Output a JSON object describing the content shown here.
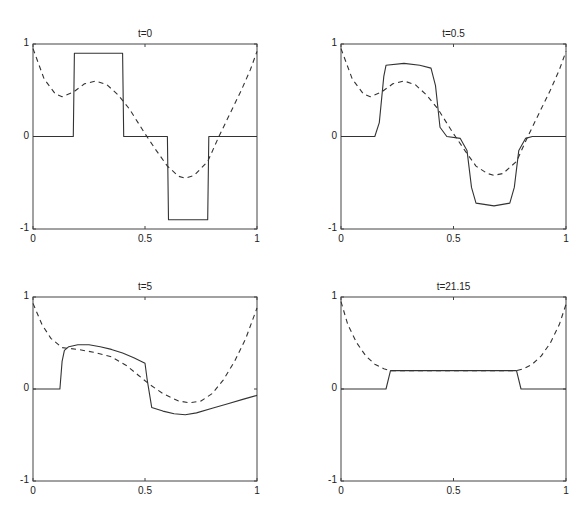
{
  "chart_data": [
    {
      "type": "line",
      "title": "t=0",
      "xlabel": "",
      "ylabel": "",
      "xlim": [
        0,
        1
      ],
      "ylim": [
        -1,
        1
      ],
      "xticks": [
        "0",
        "0.5",
        "1"
      ],
      "yticks": [
        "-1",
        "0",
        "1"
      ],
      "grid": false,
      "series": [
        {
          "name": "solution",
          "style": "solid",
          "x": [
            0,
            0.18,
            0.185,
            0.4,
            0.405,
            0.6,
            0.605,
            0.78,
            0.785,
            1
          ],
          "y": [
            0,
            0,
            0.9,
            0.9,
            0,
            0,
            -0.9,
            -0.9,
            0,
            0
          ]
        },
        {
          "name": "reference",
          "style": "dashed",
          "x": [
            0,
            0.05,
            0.1,
            0.13,
            0.18,
            0.23,
            0.28,
            0.33,
            0.38,
            0.43,
            0.5,
            0.55,
            0.6,
            0.65,
            0.68,
            0.72,
            0.78,
            0.83,
            0.88,
            0.93,
            0.97,
            1
          ],
          "y": [
            0.95,
            0.62,
            0.46,
            0.43,
            0.48,
            0.57,
            0.6,
            0.56,
            0.45,
            0.3,
            0.03,
            -0.15,
            -0.32,
            -0.43,
            -0.45,
            -0.42,
            -0.27,
            0,
            0.25,
            0.5,
            0.72,
            0.92
          ]
        }
      ]
    },
    {
      "type": "line",
      "title": "t=0.5",
      "xlabel": "",
      "ylabel": "",
      "xlim": [
        0,
        1
      ],
      "ylim": [
        -1,
        1
      ],
      "xticks": [
        "0",
        "0.5",
        "1"
      ],
      "yticks": [
        "-1",
        "0",
        "1"
      ],
      "grid": false,
      "series": [
        {
          "name": "solution",
          "style": "solid",
          "x": [
            0,
            0.15,
            0.17,
            0.19,
            0.2,
            0.28,
            0.35,
            0.4,
            0.42,
            0.44,
            0.47,
            0.53,
            0.56,
            0.58,
            0.6,
            0.68,
            0.75,
            0.77,
            0.79,
            0.82,
            0.85,
            1
          ],
          "y": [
            0,
            0,
            0.15,
            0.65,
            0.77,
            0.79,
            0.77,
            0.74,
            0.55,
            0.1,
            0.0,
            -0.02,
            -0.15,
            -0.55,
            -0.72,
            -0.75,
            -0.72,
            -0.55,
            -0.15,
            -0.02,
            0,
            0
          ]
        },
        {
          "name": "reference",
          "style": "dashed",
          "x": [
            0,
            0.05,
            0.1,
            0.13,
            0.18,
            0.23,
            0.28,
            0.33,
            0.38,
            0.43,
            0.5,
            0.55,
            0.6,
            0.65,
            0.68,
            0.72,
            0.78,
            0.83,
            0.88,
            0.93,
            0.97,
            1
          ],
          "y": [
            0.95,
            0.62,
            0.46,
            0.43,
            0.48,
            0.57,
            0.6,
            0.56,
            0.45,
            0.3,
            0.03,
            -0.15,
            -0.32,
            -0.4,
            -0.42,
            -0.4,
            -0.27,
            0,
            0.25,
            0.5,
            0.72,
            0.92
          ]
        }
      ]
    },
    {
      "type": "line",
      "title": "t=5",
      "xlabel": "",
      "ylabel": "",
      "xlim": [
        0,
        1
      ],
      "ylim": [
        -1,
        1
      ],
      "xticks": [
        "0",
        "0.5",
        "1"
      ],
      "yticks": [
        "-1",
        "0",
        "1"
      ],
      "grid": false,
      "series": [
        {
          "name": "solution",
          "style": "solid",
          "x": [
            0,
            0.12,
            0.13,
            0.14,
            0.16,
            0.2,
            0.25,
            0.3,
            0.35,
            0.4,
            0.45,
            0.5,
            0.51,
            0.53,
            0.58,
            0.63,
            0.68,
            0.73,
            0.8,
            0.87,
            0.94,
            1
          ],
          "y": [
            0,
            0,
            0.3,
            0.42,
            0.46,
            0.48,
            0.48,
            0.46,
            0.43,
            0.39,
            0.34,
            0.28,
            0.1,
            -0.2,
            -0.24,
            -0.27,
            -0.28,
            -0.26,
            -0.21,
            -0.16,
            -0.11,
            -0.07
          ]
        },
        {
          "name": "reference",
          "style": "dashed",
          "x": [
            0,
            0.04,
            0.08,
            0.13,
            0.2,
            0.27,
            0.35,
            0.42,
            0.47,
            0.52,
            0.58,
            0.65,
            0.7,
            0.75,
            0.8,
            0.85,
            0.9,
            0.95,
            1
          ],
          "y": [
            0.93,
            0.7,
            0.55,
            0.45,
            0.43,
            0.4,
            0.35,
            0.25,
            0.15,
            0.05,
            -0.05,
            -0.13,
            -0.15,
            -0.13,
            -0.05,
            0.1,
            0.3,
            0.55,
            0.88
          ]
        }
      ]
    },
    {
      "type": "line",
      "title": "t=21.15",
      "xlabel": "",
      "ylabel": "",
      "xlim": [
        0,
        1
      ],
      "ylim": [
        -1,
        1
      ],
      "xticks": [
        "0",
        "0.5",
        "1"
      ],
      "yticks": [
        "-1",
        "0",
        "1"
      ],
      "grid": false,
      "series": [
        {
          "name": "solution",
          "style": "solid",
          "x": [
            0,
            0.2,
            0.22,
            0.78,
            0.8,
            1
          ],
          "y": [
            0,
            0,
            0.2,
            0.2,
            0,
            0
          ]
        },
        {
          "name": "reference",
          "style": "dashed",
          "x": [
            0,
            0.03,
            0.07,
            0.11,
            0.15,
            0.19,
            0.22,
            0.78,
            0.81,
            0.85,
            0.89,
            0.93,
            0.97,
            1
          ],
          "y": [
            0.95,
            0.7,
            0.5,
            0.36,
            0.27,
            0.22,
            0.2,
            0.2,
            0.22,
            0.27,
            0.36,
            0.5,
            0.7,
            0.92
          ]
        }
      ]
    }
  ]
}
